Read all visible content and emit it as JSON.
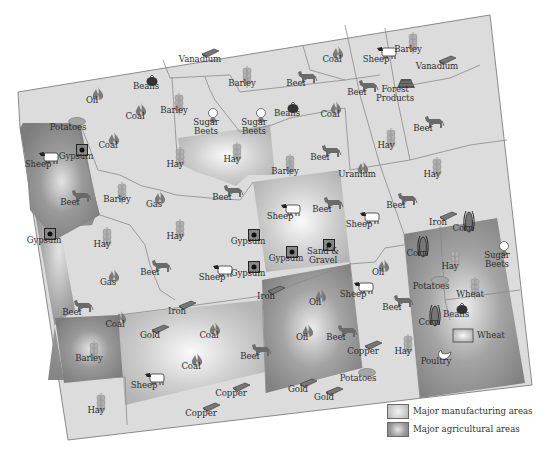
{
  "map": {
    "colors": {
      "land": "#dcdcdc",
      "border": "#8a8a8a",
      "manufacturing": "#c4c4c4",
      "agricultural": "#8f8f8f",
      "text": "#2e2e2e",
      "icon": "#6e6e6e"
    },
    "labels": [
      {
        "text": "Vanadium",
        "x": 200,
        "y": 55,
        "icon": "ingot"
      },
      {
        "text": "Barley",
        "x": 242,
        "y": 79,
        "icon": "grain"
      },
      {
        "text": "Beef",
        "x": 296,
        "y": 79,
        "icon": "cow"
      },
      {
        "text": "Coal",
        "x": 332,
        "y": 55,
        "icon": "flame"
      },
      {
        "text": "Sheep",
        "x": 376,
        "y": 55,
        "icon": "sheep"
      },
      {
        "text": "Barley",
        "x": 408,
        "y": 45,
        "icon": "grain"
      },
      {
        "text": "Vanadium",
        "x": 437,
        "y": 62,
        "icon": "ingot"
      },
      {
        "text": "Oil",
        "x": 92,
        "y": 96,
        "icon": "flame"
      },
      {
        "text": "Beans",
        "x": 146,
        "y": 82,
        "icon": "tomato"
      },
      {
        "text": "Coal",
        "x": 135,
        "y": 112,
        "icon": "flame"
      },
      {
        "text": "Barley",
        "x": 174,
        "y": 106,
        "icon": "grain"
      },
      {
        "text": "Sugar Beets",
        "x": 206,
        "y": 118,
        "icon": "sugarbeet"
      },
      {
        "text": "Sugar Beets",
        "x": 254,
        "y": 118,
        "icon": "sugarbeet"
      },
      {
        "text": "Beans",
        "x": 287,
        "y": 109,
        "icon": "tomato"
      },
      {
        "text": "Coal",
        "x": 330,
        "y": 110,
        "icon": "flame"
      },
      {
        "text": "Beef",
        "x": 357,
        "y": 88,
        "icon": "cow"
      },
      {
        "text": "Forest Products",
        "x": 395,
        "y": 85,
        "icon": "logs"
      },
      {
        "text": "Beef",
        "x": 423,
        "y": 124,
        "icon": "cow"
      },
      {
        "text": "Potatoes",
        "x": 68,
        "y": 123,
        "icon": "potato"
      },
      {
        "text": "Coal",
        "x": 108,
        "y": 141,
        "icon": "flame"
      },
      {
        "text": "Sheep",
        "x": 38,
        "y": 160,
        "icon": "sheep"
      },
      {
        "text": "Gypsum",
        "x": 76,
        "y": 152,
        "icon": "gypsum"
      },
      {
        "text": "Hay",
        "x": 175,
        "y": 160,
        "icon": "grain"
      },
      {
        "text": "Hay",
        "x": 232,
        "y": 155,
        "icon": "grain"
      },
      {
        "text": "Beef",
        "x": 320,
        "y": 153,
        "icon": "cow"
      },
      {
        "text": "Hay",
        "x": 386,
        "y": 141,
        "icon": "grain"
      },
      {
        "text": "Barley",
        "x": 285,
        "y": 167,
        "icon": "grain"
      },
      {
        "text": "Uranium",
        "x": 357,
        "y": 170,
        "icon": "flame"
      },
      {
        "text": "Hay",
        "x": 432,
        "y": 170,
        "icon": "grain"
      },
      {
        "text": "Beef",
        "x": 70,
        "y": 198,
        "icon": "cow"
      },
      {
        "text": "Barley",
        "x": 117,
        "y": 195,
        "icon": "grain"
      },
      {
        "text": "Gas",
        "x": 154,
        "y": 200,
        "icon": "flame"
      },
      {
        "text": "Beef",
        "x": 222,
        "y": 193,
        "icon": "cow"
      },
      {
        "text": "Sheep",
        "x": 280,
        "y": 212,
        "icon": "sheep"
      },
      {
        "text": "Beef",
        "x": 322,
        "y": 205,
        "icon": "cow"
      },
      {
        "text": "Sheep",
        "x": 359,
        "y": 220,
        "icon": "sheep"
      },
      {
        "text": "Beef",
        "x": 396,
        "y": 201,
        "icon": "cow"
      },
      {
        "text": "Iron",
        "x": 438,
        "y": 218,
        "icon": "ingot"
      },
      {
        "text": "Corn",
        "x": 463,
        "y": 224,
        "icon": "corn"
      },
      {
        "text": "Hay",
        "x": 175,
        "y": 232,
        "icon": "grain"
      },
      {
        "text": "Gypsum",
        "x": 248,
        "y": 237,
        "icon": "gypsum"
      },
      {
        "text": "Gypsum",
        "x": 44,
        "y": 236,
        "icon": "gypsum"
      },
      {
        "text": "Hay",
        "x": 102,
        "y": 240,
        "icon": "grain"
      },
      {
        "text": "Sand & Gravel",
        "x": 323,
        "y": 247,
        "icon": "gypsum"
      },
      {
        "text": "Gypsum",
        "x": 286,
        "y": 254,
        "icon": "gypsum"
      },
      {
        "text": "Corn",
        "x": 417,
        "y": 249,
        "icon": "corn"
      },
      {
        "text": "Sugar Beets",
        "x": 497,
        "y": 251,
        "icon": "sugarbeet"
      },
      {
        "text": "Beef",
        "x": 150,
        "y": 268,
        "icon": "cow"
      },
      {
        "text": "Sheep",
        "x": 212,
        "y": 273,
        "icon": "sheep"
      },
      {
        "text": "Gypsum",
        "x": 248,
        "y": 269,
        "icon": "gypsum"
      },
      {
        "text": "Gas",
        "x": 108,
        "y": 278,
        "icon": "flame"
      },
      {
        "text": "Hay",
        "x": 450,
        "y": 262,
        "icon": "grain"
      },
      {
        "text": "Oil",
        "x": 378,
        "y": 268,
        "icon": "flame"
      },
      {
        "text": "Potatoes",
        "x": 431,
        "y": 282,
        "icon": "potato"
      },
      {
        "text": "Sheep",
        "x": 353,
        "y": 290,
        "icon": "sheep"
      },
      {
        "text": "Iron",
        "x": 266,
        "y": 292,
        "icon": "ingot"
      },
      {
        "text": "Oil",
        "x": 315,
        "y": 298,
        "icon": "flame"
      },
      {
        "text": "Beef",
        "x": 392,
        "y": 303,
        "icon": "cow"
      },
      {
        "text": "Wheat",
        "x": 470,
        "y": 290,
        "icon": "grain"
      },
      {
        "text": "Beef",
        "x": 72,
        "y": 308,
        "icon": "cow"
      },
      {
        "text": "Coal",
        "x": 115,
        "y": 320,
        "icon": "flame"
      },
      {
        "text": "Iron",
        "x": 177,
        "y": 307,
        "icon": "ingot"
      },
      {
        "text": "Gold",
        "x": 150,
        "y": 331,
        "icon": "ingot"
      },
      {
        "text": "Coal",
        "x": 209,
        "y": 331,
        "icon": "flame"
      },
      {
        "text": "Oil",
        "x": 302,
        "y": 333,
        "icon": "flame"
      },
      {
        "text": "Beef",
        "x": 336,
        "y": 333,
        "icon": "cow"
      },
      {
        "text": "Corn",
        "x": 429,
        "y": 318,
        "icon": "corn"
      },
      {
        "text": "Beans",
        "x": 456,
        "y": 310,
        "icon": "tomato"
      },
      {
        "text": "Beef",
        "x": 250,
        "y": 352,
        "icon": "cow"
      },
      {
        "text": "Coal",
        "x": 191,
        "y": 362,
        "icon": "flame"
      },
      {
        "text": "Copper",
        "x": 363,
        "y": 347,
        "icon": "ingot"
      },
      {
        "text": "Hay",
        "x": 403,
        "y": 347,
        "icon": "grain"
      },
      {
        "text": "Poultry",
        "x": 436,
        "y": 357,
        "icon": "poultry"
      },
      {
        "text": "Barley",
        "x": 89,
        "y": 354,
        "icon": "grain"
      },
      {
        "text": "Sheep",
        "x": 144,
        "y": 381,
        "icon": "sheep"
      },
      {
        "text": "Copper",
        "x": 231,
        "y": 389,
        "icon": "ingot"
      },
      {
        "text": "Potatoes",
        "x": 358,
        "y": 374,
        "icon": "potato"
      },
      {
        "text": "Gold",
        "x": 298,
        "y": 385,
        "icon": "ingot"
      },
      {
        "text": "Gold",
        "x": 324,
        "y": 393,
        "icon": "ingot"
      },
      {
        "text": "Copper",
        "x": 201,
        "y": 409,
        "icon": "ingot"
      },
      {
        "text": "Hay",
        "x": 96,
        "y": 406,
        "icon": "grain"
      }
    ],
    "inline_legend": {
      "text": "Wheat",
      "swatch": "manufacturing"
    }
  },
  "legend": {
    "items": [
      {
        "label": "Major manufacturing areas",
        "kind": "manufacturing"
      },
      {
        "label": "Major agricultural areas",
        "kind": "agricultural"
      }
    ]
  }
}
